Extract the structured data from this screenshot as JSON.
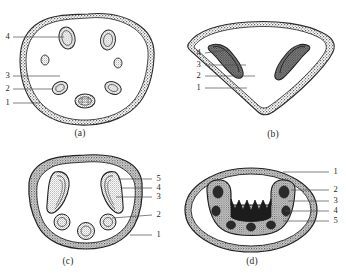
{
  "figure": {
    "background_color": "#ffffff",
    "ink_color": "#2b2b2b",
    "stipple_color": "#555555",
    "panel_count": 4
  },
  "panels": [
    {
      "id": "a",
      "caption": "(a)",
      "caption_x": 80,
      "caption_y": 130,
      "outline_shape": "rounded-shield",
      "labels": [
        {
          "num": "4",
          "x": 4,
          "y": 33,
          "line_x1": 13,
          "line_y1": 37,
          "line_x2": 64,
          "line_y2": 37
        },
        {
          "num": "3",
          "x": 4,
          "y": 72,
          "line_x1": 13,
          "line_y1": 76,
          "line_x2": 60,
          "line_y2": 76
        },
        {
          "num": "2",
          "x": 4,
          "y": 85,
          "line_x1": 13,
          "line_y1": 89,
          "line_x2": 50,
          "line_y2": 89
        },
        {
          "num": "1",
          "x": 4,
          "y": 99,
          "line_x1": 13,
          "line_y1": 103,
          "line_x2": 40,
          "line_y2": 103
        }
      ],
      "inclusions": 7
    },
    {
      "id": "b",
      "caption": "(b)",
      "caption_x": 253,
      "caption_y": 131,
      "outline_shape": "triangular-heart",
      "labels": [
        {
          "num": "4",
          "x": 196,
          "y": 49,
          "line_x1": 205,
          "line_y1": 53,
          "line_x2": 228,
          "line_y2": 53
        },
        {
          "num": "3",
          "x": 196,
          "y": 61,
          "line_x1": 205,
          "line_y1": 65,
          "line_x2": 246,
          "line_y2": 65
        },
        {
          "num": "2",
          "x": 196,
          "y": 72,
          "line_x1": 205,
          "line_y1": 76,
          "line_x2": 253,
          "line_y2": 76
        },
        {
          "num": "1",
          "x": 196,
          "y": 84,
          "line_x1": 205,
          "line_y1": 88,
          "line_x2": 246,
          "line_y2": 88
        }
      ],
      "inclusions": 2
    },
    {
      "id": "c",
      "caption": "(c)",
      "caption_x": 60,
      "caption_y": 258,
      "outline_shape": "thick-ring-dome",
      "labels": [
        {
          "num": "5",
          "x": 155,
          "y": 175,
          "line_x1": 153,
          "line_y1": 179,
          "line_x2": 119,
          "line_y2": 179
        },
        {
          "num": "4",
          "x": 155,
          "y": 184,
          "line_x1": 153,
          "line_y1": 188,
          "line_x2": 121,
          "line_y2": 188
        },
        {
          "num": "3",
          "x": 155,
          "y": 193,
          "line_x1": 153,
          "line_y1": 197,
          "line_x2": 117,
          "line_y2": 197
        },
        {
          "num": "2",
          "x": 155,
          "y": 211,
          "line_x1": 153,
          "line_y1": 215,
          "line_x2": 110,
          "line_y2": 215
        },
        {
          "num": "1",
          "x": 155,
          "y": 231,
          "line_x1": 153,
          "line_y1": 235,
          "line_x2": 128,
          "line_y2": 235
        }
      ],
      "inclusions": 5
    },
    {
      "id": "d",
      "caption": "(d)",
      "caption_x": 252,
      "caption_y": 258,
      "outline_shape": "ellipse-with-horseshoe",
      "labels": [
        {
          "num": "1",
          "x": 331,
          "y": 168,
          "line_x1": 329,
          "line_y1": 172,
          "line_x2": 283,
          "line_y2": 172
        },
        {
          "num": "2",
          "x": 331,
          "y": 186,
          "line_x1": 329,
          "line_y1": 190,
          "line_x2": 291,
          "line_y2": 190
        },
        {
          "num": "3",
          "x": 331,
          "y": 197,
          "line_x1": 329,
          "line_y1": 201,
          "line_x2": 288,
          "line_y2": 201
        },
        {
          "num": "4",
          "x": 331,
          "y": 207,
          "line_x1": 329,
          "line_y1": 211,
          "line_x2": 285,
          "line_y2": 211
        },
        {
          "num": "5",
          "x": 331,
          "y": 217,
          "line_x1": 329,
          "line_y1": 221,
          "line_x2": 283,
          "line_y2": 221
        }
      ],
      "inclusions": 1
    }
  ]
}
